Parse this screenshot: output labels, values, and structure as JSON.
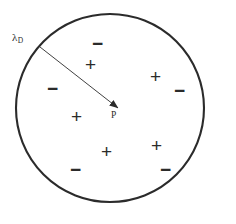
{
  "figure": {
    "background_color": "#ffffff",
    "stroke_color": "#2b2b2b"
  },
  "circle": {
    "name": "debye-sphere",
    "cx": 110,
    "cy": 108,
    "r": 94,
    "stroke_width": 2.1,
    "fill": "none"
  },
  "radius_arrow": {
    "name": "debye-length-arrow",
    "x1": 40,
    "y1": 47,
    "x2": 118,
    "y2": 108,
    "stroke_width": 0.9,
    "arrowhead": true
  },
  "labels": {
    "debye_length": {
      "text": "λ",
      "subscript": "D",
      "x": 12,
      "y": 32
    },
    "point": {
      "text": "P",
      "x": 111,
      "y": 111
    }
  },
  "charges": [
    {
      "sign": "−",
      "x": 92,
      "y": 34
    },
    {
      "sign": "+",
      "x": 85,
      "y": 55
    },
    {
      "sign": "+",
      "x": 150,
      "y": 67
    },
    {
      "sign": "−",
      "x": 174,
      "y": 81
    },
    {
      "sign": "−",
      "x": 47,
      "y": 79
    },
    {
      "sign": "+",
      "x": 71,
      "y": 107
    },
    {
      "sign": "+",
      "x": 151,
      "y": 136
    },
    {
      "sign": "+",
      "x": 101,
      "y": 142
    },
    {
      "sign": "−",
      "x": 70,
      "y": 160
    },
    {
      "sign": "−",
      "x": 160,
      "y": 160
    }
  ]
}
